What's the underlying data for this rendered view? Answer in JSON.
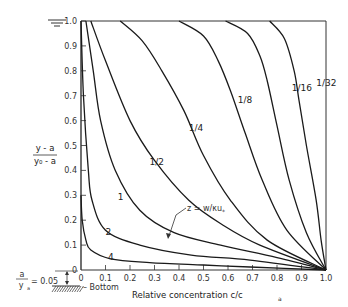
{
  "chart_data": {
    "type": "line",
    "title": "",
    "xlabel": "Relative concentration c/c_a",
    "ylabel": "(y - a)/(y_0 - a)",
    "xlim": [
      0,
      1.0
    ],
    "ylim": [
      0,
      1.0
    ],
    "grid": false,
    "x_ticks": [
      "0",
      "0.1",
      "0.2",
      "0.3",
      "0.4",
      "0.5",
      "0.6",
      "0.7",
      "0.8",
      "0.9",
      "1.0"
    ],
    "y_ticks": [
      "0",
      "0.1",
      "0.2",
      "0.3",
      "0.4",
      "0.5",
      "0.6",
      "0.7",
      "0.8",
      "0.9",
      "1.0"
    ],
    "annotations": {
      "z_label": "z = w/κu*",
      "a_ratio": "a/y_0 = 0.05",
      "bottom_label": "Bottom"
    },
    "series": [
      {
        "name": "1/32",
        "points": [
          [
            0.77,
            1.0
          ],
          [
            0.83,
            0.93
          ],
          [
            0.87,
            0.8
          ],
          [
            0.89,
            0.68
          ],
          [
            0.92,
            0.5
          ],
          [
            0.96,
            0.28
          ],
          [
            0.98,
            0.12
          ],
          [
            1.0,
            0.0
          ]
        ]
      },
      {
        "name": "1/16",
        "points": [
          [
            0.59,
            1.0
          ],
          [
            0.68,
            0.95
          ],
          [
            0.73,
            0.86
          ],
          [
            0.76,
            0.76
          ],
          [
            0.8,
            0.58
          ],
          [
            0.85,
            0.36
          ],
          [
            0.92,
            0.15
          ],
          [
            1.0,
            0.0
          ]
        ]
      },
      {
        "name": "1/8",
        "points": [
          [
            0.4,
            1.0
          ],
          [
            0.5,
            0.94
          ],
          [
            0.56,
            0.84
          ],
          [
            0.61,
            0.72
          ],
          [
            0.67,
            0.55
          ],
          [
            0.74,
            0.36
          ],
          [
            0.84,
            0.16
          ],
          [
            1.0,
            0.0
          ]
        ]
      },
      {
        "name": "1/4",
        "points": [
          [
            0.16,
            1.0
          ],
          [
            0.25,
            0.92
          ],
          [
            0.33,
            0.8
          ],
          [
            0.42,
            0.64
          ],
          [
            0.5,
            0.46
          ],
          [
            0.61,
            0.28
          ],
          [
            0.76,
            0.12
          ],
          [
            1.0,
            0.0
          ]
        ]
      },
      {
        "name": "1/2",
        "points": [
          [
            0.04,
            1.0
          ],
          [
            0.1,
            0.84
          ],
          [
            0.2,
            0.6
          ],
          [
            0.3,
            0.44
          ],
          [
            0.44,
            0.28
          ],
          [
            0.58,
            0.18
          ],
          [
            0.73,
            0.1
          ],
          [
            1.0,
            0.0
          ]
        ]
      },
      {
        "name": "1",
        "points": [
          [
            0.02,
            1.0
          ],
          [
            0.05,
            0.8
          ],
          [
            0.08,
            0.6
          ],
          [
            0.14,
            0.4
          ],
          [
            0.24,
            0.24
          ],
          [
            0.38,
            0.15
          ],
          [
            0.57,
            0.1
          ],
          [
            0.8,
            0.05
          ],
          [
            1.0,
            0.0
          ]
        ]
      },
      {
        "name": "2",
        "points": [
          [
            0.0,
            1.0
          ],
          [
            0.01,
            0.7
          ],
          [
            0.03,
            0.4
          ],
          [
            0.045,
            0.28
          ],
          [
            0.1,
            0.16
          ],
          [
            0.24,
            0.1
          ],
          [
            0.45,
            0.06
          ],
          [
            0.69,
            0.04
          ],
          [
            1.0,
            0.0
          ]
        ]
      },
      {
        "name": "4",
        "points": [
          [
            0.0,
            0.3
          ],
          [
            0.005,
            0.2
          ],
          [
            0.02,
            0.12
          ],
          [
            0.04,
            0.08
          ],
          [
            0.12,
            0.045
          ],
          [
            0.28,
            0.03
          ],
          [
            0.5,
            0.02
          ],
          [
            0.69,
            0.012
          ],
          [
            1.0,
            0.0
          ]
        ]
      }
    ],
    "label_positions": [
      {
        "text": "1/32",
        "x": 0.96,
        "y": 0.74
      },
      {
        "text": "1/16",
        "x": 0.86,
        "y": 0.72
      },
      {
        "text": "1/8",
        "x": 0.64,
        "y": 0.67
      },
      {
        "text": "1/4",
        "x": 0.44,
        "y": 0.56
      },
      {
        "text": "1/2",
        "x": 0.28,
        "y": 0.42
      },
      {
        "text": "1",
        "x": 0.15,
        "y": 0.28
      },
      {
        "text": "2",
        "x": 0.1,
        "y": 0.14
      },
      {
        "text": "4",
        "x": 0.11,
        "y": 0.04
      }
    ]
  },
  "labels": {
    "ylabel_top": "y - a",
    "ylabel_bottom": "y₀ - a",
    "xlabel": "Relative concentration  c/c",
    "xlabel_sub": "a",
    "z_label": "z = w/κu",
    "z_sub": "*",
    "a_num": "a",
    "a_den": "y",
    "a_den_sub": "a",
    "a_eq": "= 0.05",
    "bottom": "– Bottom"
  }
}
